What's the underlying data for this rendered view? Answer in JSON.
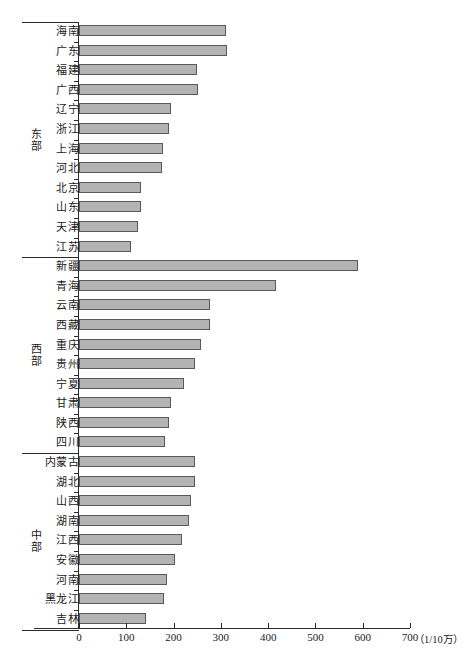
{
  "chart_data": {
    "type": "bar",
    "orientation": "horizontal",
    "title": "",
    "xlabel": "",
    "ylabel": "",
    "xunit": "（1/10万）",
    "xlim": [
      0,
      700
    ],
    "xticks": [
      0,
      100,
      200,
      300,
      400,
      500,
      600,
      700
    ],
    "grid": false,
    "legend": "none",
    "bar_fill": "#b3b3b3",
    "bar_stroke": "#59595c",
    "groups": [
      {
        "name": "东部",
        "categories": [
          "海南",
          "广东",
          "福建",
          "广西",
          "辽宁",
          "浙江",
          "上海",
          "河北",
          "北京",
          "山东",
          "天津",
          "江苏"
        ],
        "values": [
          310,
          312,
          249,
          252,
          194,
          190,
          177,
          176,
          131,
          131,
          124,
          110
        ]
      },
      {
        "name": "西部",
        "categories": [
          "新疆",
          "青海",
          "云南",
          "西藏",
          "重庆",
          "贵州",
          "宁夏",
          "甘肃",
          "陕西",
          "四川"
        ],
        "values": [
          590,
          416,
          278,
          278,
          257,
          245,
          222,
          195,
          190,
          181
        ]
      },
      {
        "name": "中部",
        "categories": [
          "内蒙古",
          "湖北",
          "山西",
          "湖南",
          "江西",
          "安徽",
          "河南",
          "黑龙江",
          "吉林"
        ],
        "values": [
          245,
          245,
          236,
          232,
          217,
          203,
          186,
          179,
          141
        ]
      }
    ]
  }
}
